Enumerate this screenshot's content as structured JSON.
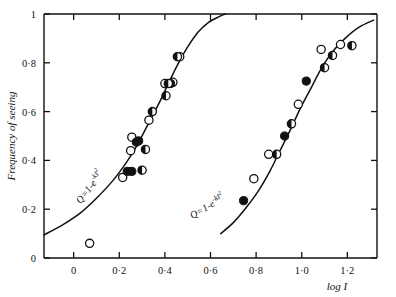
{
  "chart_data": {
    "type": "scatter",
    "title": "",
    "xlabel": "log I",
    "ylabel": "Frequency of seeing",
    "xlim": [
      -0.13,
      1.33
    ],
    "ylim": [
      0,
      1
    ],
    "grid": false,
    "legend": "none",
    "xticks": [
      0,
      0.2,
      0.4,
      0.6,
      0.8,
      1.0,
      1.2
    ],
    "xticklabels": [
      "0",
      "0·2",
      "0·4",
      "0·6",
      "0·8",
      "1·0",
      "1·2"
    ],
    "yticks": [
      0,
      0.2,
      0.4,
      0.6,
      0.8,
      1.0
    ],
    "yticklabels": [
      "0",
      "0·2",
      "0·4",
      "0·6",
      "0·8",
      "1"
    ],
    "annotations": [
      {
        "name": "left-curve-formula",
        "text": "Q=1-e",
        "exponent": "-kI",
        "exponent2": "2",
        "x": 0.03,
        "y": 0.22,
        "rotation": -52
      },
      {
        "name": "right-curve-formula",
        "text": "Q=1-e",
        "exponent": "-kI",
        "exponent2": "2",
        "x": 0.52,
        "y": 0.16,
        "rotation": -30
      }
    ],
    "series": [
      {
        "name": "open-circle",
        "marker": "open",
        "points": [
          {
            "x": 0.07,
            "y": 0.06
          },
          {
            "x": 0.215,
            "y": 0.33
          },
          {
            "x": 0.25,
            "y": 0.44
          },
          {
            "x": 0.255,
            "y": 0.495
          },
          {
            "x": 0.33,
            "y": 0.565
          },
          {
            "x": 0.4,
            "y": 0.715
          },
          {
            "x": 0.435,
            "y": 0.72
          },
          {
            "x": 0.465,
            "y": 0.825
          },
          {
            "x": 0.79,
            "y": 0.325
          },
          {
            "x": 0.855,
            "y": 0.425
          },
          {
            "x": 0.985,
            "y": 0.63
          },
          {
            "x": 1.085,
            "y": 0.855
          },
          {
            "x": 1.17,
            "y": 0.875
          }
        ]
      },
      {
        "name": "filled-circle",
        "marker": "filled",
        "points": [
          {
            "x": 0.235,
            "y": 0.355
          },
          {
            "x": 0.255,
            "y": 0.355
          },
          {
            "x": 0.275,
            "y": 0.475
          },
          {
            "x": 0.285,
            "y": 0.48
          },
          {
            "x": 0.425,
            "y": 0.715
          },
          {
            "x": 0.745,
            "y": 0.235
          },
          {
            "x": 0.925,
            "y": 0.5
          },
          {
            "x": 1.02,
            "y": 0.725
          }
        ]
      },
      {
        "name": "half-filled-circle",
        "marker": "half",
        "points": [
          {
            "x": 0.3,
            "y": 0.36
          },
          {
            "x": 0.315,
            "y": 0.445
          },
          {
            "x": 0.345,
            "y": 0.6
          },
          {
            "x": 0.405,
            "y": 0.665
          },
          {
            "x": 0.415,
            "y": 0.715
          },
          {
            "x": 0.455,
            "y": 0.825
          },
          {
            "x": 0.89,
            "y": 0.425
          },
          {
            "x": 0.955,
            "y": 0.55
          },
          {
            "x": 1.1,
            "y": 0.78
          },
          {
            "x": 1.135,
            "y": 0.83
          },
          {
            "x": 1.22,
            "y": 0.87
          }
        ]
      }
    ],
    "curves": [
      {
        "name": "left-fitted-curve",
        "equation": "Q=1-e^{-kI^2}",
        "points": [
          {
            "x": -0.13,
            "y": 0.095
          },
          {
            "x": -0.05,
            "y": 0.135
          },
          {
            "x": 0.03,
            "y": 0.185
          },
          {
            "x": 0.1,
            "y": 0.245
          },
          {
            "x": 0.17,
            "y": 0.315
          },
          {
            "x": 0.23,
            "y": 0.39
          },
          {
            "x": 0.28,
            "y": 0.465
          },
          {
            "x": 0.33,
            "y": 0.555
          },
          {
            "x": 0.38,
            "y": 0.645
          },
          {
            "x": 0.42,
            "y": 0.725
          },
          {
            "x": 0.46,
            "y": 0.8
          },
          {
            "x": 0.5,
            "y": 0.865
          },
          {
            "x": 0.545,
            "y": 0.925
          },
          {
            "x": 0.59,
            "y": 0.965
          },
          {
            "x": 0.64,
            "y": 0.99
          },
          {
            "x": 0.665,
            "y": 1.0
          }
        ]
      },
      {
        "name": "right-fitted-curve",
        "equation": "Q=1-e^{-kI^2}",
        "points": [
          {
            "x": 0.645,
            "y": 0.1
          },
          {
            "x": 0.7,
            "y": 0.145
          },
          {
            "x": 0.755,
            "y": 0.205
          },
          {
            "x": 0.81,
            "y": 0.275
          },
          {
            "x": 0.86,
            "y": 0.355
          },
          {
            "x": 0.905,
            "y": 0.44
          },
          {
            "x": 0.95,
            "y": 0.525
          },
          {
            "x": 0.995,
            "y": 0.615
          },
          {
            "x": 1.04,
            "y": 0.695
          },
          {
            "x": 1.085,
            "y": 0.775
          },
          {
            "x": 1.135,
            "y": 0.845
          },
          {
            "x": 1.19,
            "y": 0.9
          },
          {
            "x": 1.25,
            "y": 0.945
          },
          {
            "x": 1.315,
            "y": 0.975
          }
        ]
      }
    ]
  }
}
